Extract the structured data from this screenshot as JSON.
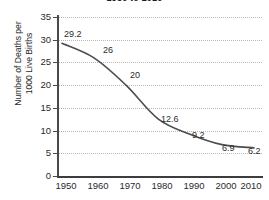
{
  "chart_data": {
    "type": "line",
    "title": "1950 to 2010",
    "xlabel": "",
    "ylabel": "Number of Deaths per 1000 Live Births",
    "ylabel_line1": "Number of Deaths per",
    "ylabel_line2": "1000 Live Births",
    "categories": [
      1950,
      1960,
      1970,
      1980,
      1990,
      2000,
      2010
    ],
    "x": [
      "1950",
      "1960",
      "1970",
      "1980",
      "1990",
      "2000",
      "2010"
    ],
    "values": [
      29.2,
      26,
      20,
      12.6,
      9.2,
      6.9,
      6.2
    ],
    "point_labels": [
      "29.2",
      "26",
      "20",
      "12.6",
      "9.2",
      "6.9",
      "6.2"
    ],
    "ylim": [
      0,
      35
    ],
    "xlim": [
      1950,
      2010
    ],
    "yticks": [
      "35",
      "30",
      "25",
      "20",
      "15",
      "10",
      "5",
      "0"
    ],
    "ytick_values": [
      35,
      30,
      25,
      20,
      15,
      10,
      5,
      0
    ],
    "grid": "horizontal-dotted",
    "legend": "none",
    "line_color": "#4d4d4d",
    "grid_color": "#b9b9b9",
    "axis_color": "#3d3d3d",
    "background": "#ffffff",
    "markers": "none"
  }
}
